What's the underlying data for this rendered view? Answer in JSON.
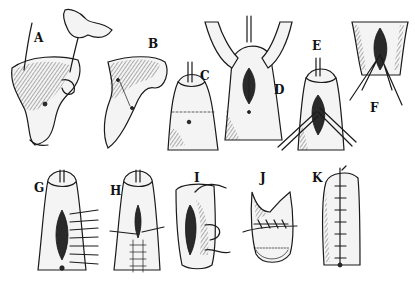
{
  "figure": {
    "panels": [
      {
        "id": "A",
        "label": "A"
      },
      {
        "id": "B",
        "label": "B"
      },
      {
        "id": "C",
        "label": "C"
      },
      {
        "id": "D",
        "label": "D"
      },
      {
        "id": "E",
        "label": "E"
      },
      {
        "id": "F",
        "label": "F"
      },
      {
        "id": "G",
        "label": "G"
      },
      {
        "id": "H",
        "label": "H"
      },
      {
        "id": "I",
        "label": "I"
      },
      {
        "id": "J",
        "label": "J"
      },
      {
        "id": "K",
        "label": "K"
      }
    ],
    "colors": {
      "ink": "#1a1a1a",
      "paper": "#ffffff"
    }
  }
}
